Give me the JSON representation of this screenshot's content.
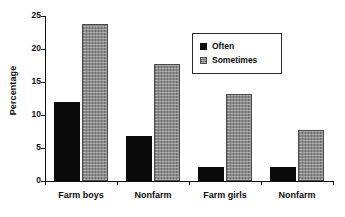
{
  "chart_data": {
    "type": "bar",
    "title": "",
    "xlabel": "",
    "ylabel": "Percentage",
    "ylim": [
      0,
      25
    ],
    "yticks": [
      0,
      5,
      10,
      15,
      20,
      25
    ],
    "ytick_labels": [
      "0",
      "5",
      "10",
      "15",
      "20",
      "25"
    ],
    "grid": false,
    "legend_position": "upper-center-right",
    "categories": [
      "Farm boys",
      "Nonfarm",
      "Farm girls",
      "Nonfarm"
    ],
    "series": [
      {
        "name": "Often",
        "color": "#0a0a0a",
        "values": [
          12.0,
          6.8,
          2.1,
          2.1
        ]
      },
      {
        "name": "Sometimes",
        "color": "#8c8c8c",
        "values": [
          23.8,
          17.8,
          13.2,
          7.7
        ]
      }
    ]
  },
  "legend": {
    "items": [
      {
        "label": "Often"
      },
      {
        "label": "Sometimes"
      }
    ]
  }
}
